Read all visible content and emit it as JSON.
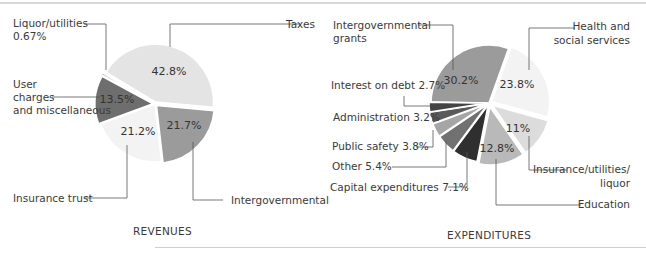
{
  "chart_data": [
    {
      "type": "pie",
      "title": "REVENUES",
      "slices": [
        {
          "label": "Taxes",
          "value": 42.8,
          "display": "42.8%",
          "color": "#e4e4e4"
        },
        {
          "label": "Intergovernmental",
          "value": 21.7,
          "display": "21.7%",
          "color": "#9b9b9b"
        },
        {
          "label": "Insurance trust",
          "value": 21.2,
          "display": "21.2%",
          "color": "#f3f3f3"
        },
        {
          "label": "User charges and miscellaneous",
          "value": 13.5,
          "display": "13.5%",
          "color": "#6e6e6e"
        },
        {
          "label": "Liquor/utilities",
          "value": 0.67,
          "display": "0.67%",
          "color": "#bdbdbd"
        }
      ]
    },
    {
      "type": "pie",
      "title": "EXPENDITURES",
      "slices": [
        {
          "label": "Intergovernmental grants",
          "value": 30.2,
          "display": "30.2%",
          "color": "#9b9b9b"
        },
        {
          "label": "Health and social services",
          "value": 23.8,
          "display": "23.8%",
          "color": "#f3f3f3"
        },
        {
          "label": "Insurance/utilities/liquor",
          "value": 11,
          "display": "11%",
          "color": "#dcdcdc"
        },
        {
          "label": "Education",
          "value": 12.8,
          "display": "12.8%",
          "color": "#b9b9b9"
        },
        {
          "label": "Capital expenditures",
          "value": 7.1,
          "display": "7.1%",
          "color": "#2f2f2f"
        },
        {
          "label": "Other",
          "value": 5.4,
          "display": "5.4%",
          "color": "#717171"
        },
        {
          "label": "Public safety",
          "value": 3.8,
          "display": "3.8%",
          "color": "#a6a6a6"
        },
        {
          "label": "Administration",
          "value": 3.2,
          "display": "3.2%",
          "color": "#5a5a5a"
        },
        {
          "label": "Interest on debt",
          "value": 2.7,
          "display": "2.7%",
          "color": "#444444"
        }
      ]
    }
  ],
  "revenues": {
    "title": "REVENUES",
    "labels": {
      "liquor_line1": "Liquor/utilities",
      "liquor_line2": "0.67%",
      "taxes": "Taxes",
      "user_line1": "User",
      "user_line2": "charges",
      "user_line3": "and miscellaneous",
      "insurance": "Insurance trust",
      "intergov": "Intergovernmental"
    },
    "pcts": {
      "taxes": "42.8%",
      "user": "13.5%",
      "insurance": "21.2%",
      "intergov": "21.7%"
    }
  },
  "expenditures": {
    "title": "EXPENDITURES",
    "labels": {
      "grants_line1": "Intergovernmental",
      "grants_line2": "grants",
      "health_line1": "Health and",
      "health_line2": "social services",
      "interest": "Interest on debt 2.7%",
      "admin": "Administration 3.2%",
      "safety": "Public safety 3.8%",
      "other": "Other 5.4%",
      "capital": "Capital expenditures 7.1%",
      "insurance_line1": "Insurance/utilities/",
      "insurance_line2": "liquor",
      "education": "Education"
    },
    "pcts": {
      "grants": "30.2%",
      "health": "23.8%",
      "insurance": "11%",
      "education": "12.8%"
    }
  }
}
